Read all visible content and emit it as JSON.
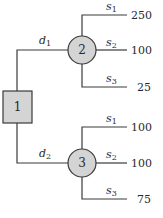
{
  "diagram": {
    "type": "decision-tree",
    "decision_node": {
      "id": "1",
      "label": "1",
      "shape": "square"
    },
    "chance_nodes": [
      {
        "id": "2",
        "label": "2",
        "shape": "circle",
        "incoming_branch": {
          "symbol": "d",
          "subscript": "1"
        },
        "outcomes": [
          {
            "symbol": "s",
            "subscript": "1",
            "payoff": "250"
          },
          {
            "symbol": "s",
            "subscript": "2",
            "payoff": "100"
          },
          {
            "symbol": "s",
            "subscript": "3",
            "payoff": "25"
          }
        ]
      },
      {
        "id": "3",
        "label": "3",
        "shape": "circle",
        "incoming_branch": {
          "symbol": "d",
          "subscript": "2"
        },
        "outcomes": [
          {
            "symbol": "s",
            "subscript": "1",
            "payoff": "100"
          },
          {
            "symbol": "s",
            "subscript": "2",
            "payoff": "100"
          },
          {
            "symbol": "s",
            "subscript": "3",
            "payoff": "75"
          }
        ]
      }
    ],
    "colors": {
      "node_fill": "#d4d4d4",
      "stroke": "#3a3a3a",
      "text": "#2a2a2a"
    }
  }
}
